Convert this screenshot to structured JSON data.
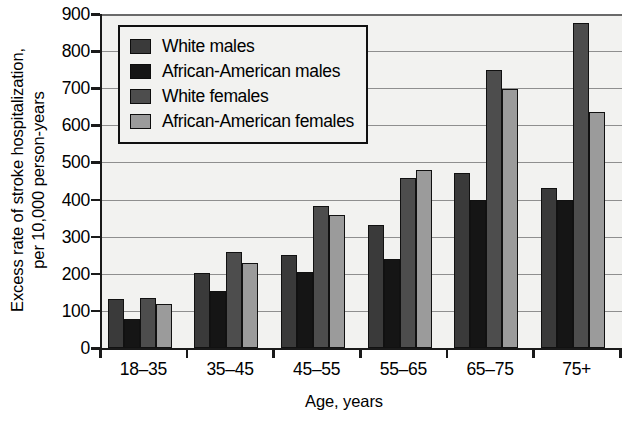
{
  "chart_data": {
    "type": "bar",
    "title": "",
    "xlabel": "Age, years",
    "ylabel": "Excess rate of stroke hospitalization, per 10,000 person-years",
    "ylabel_line1": "Excess rate of stroke hospitalization,",
    "ylabel_line2": "per 10,000 person-years",
    "categories": [
      "18–35",
      "35–45",
      "45–55",
      "55–65",
      "65–75",
      "75+"
    ],
    "ylim": [
      0,
      900
    ],
    "yticks": [
      0,
      100,
      200,
      300,
      400,
      500,
      600,
      700,
      800,
      900
    ],
    "ytick_labels": [
      "0",
      "100",
      "200",
      "300",
      "400",
      "500",
      "600",
      "700",
      "800",
      "900"
    ],
    "grid": true,
    "legend_position": "upper-left",
    "series": [
      {
        "name": "White males",
        "color": "#3a3a3a",
        "values": [
          133,
          201,
          250,
          331,
          472,
          432
        ]
      },
      {
        "name": "African-American males",
        "color": "#151515",
        "values": [
          79,
          153,
          205,
          241,
          400,
          399
        ]
      },
      {
        "name": "White females",
        "color": "#4d4d4d",
        "values": [
          134,
          258,
          383,
          458,
          750,
          877
        ]
      },
      {
        "name": "African-American females",
        "color": "#9b9b9b",
        "values": [
          119,
          229,
          359,
          479,
          697,
          637
        ]
      }
    ]
  }
}
